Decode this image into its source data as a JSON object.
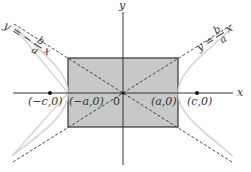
{
  "figure": {
    "type": "hyperbola-asymptote-diagram",
    "colors": {
      "rectangle_fill": "#c8c8c8",
      "rectangle_stroke": "#333333",
      "axis": "#333333",
      "asymptote": "#333333",
      "hyperbola": "#d8d8d8",
      "point": "#111111"
    },
    "axes": {
      "x_label": "x",
      "y_label": "y",
      "origin_label": "0"
    },
    "points": [
      {
        "id": "neg-c",
        "label": "(−c,0)"
      },
      {
        "id": "neg-a",
        "label": "(−a,0)"
      },
      {
        "id": "pos-a",
        "label": "(a,0)"
      },
      {
        "id": "pos-c",
        "label": "(c,0)"
      }
    ],
    "asymptotes": {
      "left": {
        "lhs": "y =",
        "sign": "−",
        "num": "b",
        "den": "a",
        "var": "x"
      },
      "right": {
        "lhs": "y =",
        "sign": "",
        "num": "b",
        "den": "a",
        "var": "x"
      }
    }
  }
}
